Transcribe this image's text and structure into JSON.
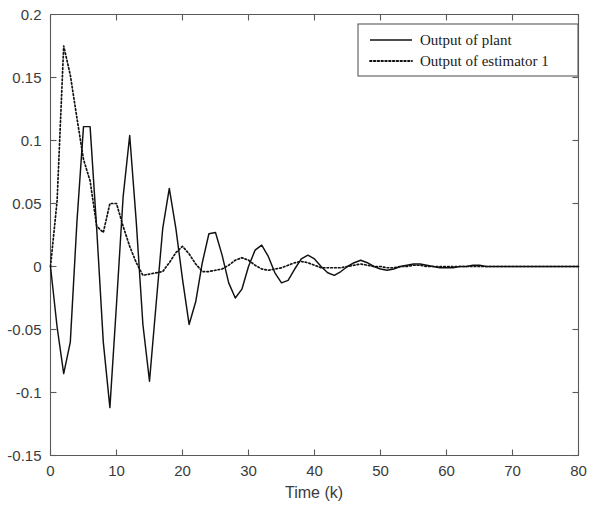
{
  "chart_data": {
    "type": "line",
    "title": "",
    "xlabel": "Time (k)",
    "ylabel": "",
    "xlim": [
      0,
      80
    ],
    "ylim": [
      -0.15,
      0.2
    ],
    "xticks": [
      0,
      10,
      20,
      30,
      40,
      50,
      60,
      70,
      80
    ],
    "xtick_labels": [
      "0",
      "10",
      "20",
      "30",
      "40",
      "50",
      "60",
      "70",
      "80"
    ],
    "yticks": [
      -0.15,
      -0.1,
      -0.05,
      0,
      0.05,
      0.1,
      0.15,
      0.2
    ],
    "ytick_labels": [
      "-0.15",
      "-0.1",
      "-0.05",
      "0",
      "0.05",
      "0.1",
      "0.15",
      "0.2"
    ],
    "grid": false,
    "legend_position": "upper right",
    "legend_entries": [
      {
        "label": "Output of plant",
        "style": "solid"
      },
      {
        "label": "Output of estimator 1",
        "style": "dotted"
      }
    ],
    "x": [
      0,
      1,
      2,
      3,
      4,
      5,
      6,
      7,
      8,
      9,
      10,
      11,
      12,
      13,
      14,
      15,
      16,
      17,
      18,
      19,
      20,
      21,
      22,
      23,
      24,
      25,
      26,
      27,
      28,
      29,
      30,
      31,
      32,
      33,
      34,
      35,
      36,
      37,
      38,
      39,
      40,
      41,
      42,
      43,
      44,
      45,
      46,
      47,
      48,
      49,
      50,
      51,
      52,
      53,
      54,
      55,
      56,
      57,
      58,
      59,
      60,
      61,
      62,
      63,
      64,
      65,
      66,
      67,
      68,
      69,
      70,
      71,
      72,
      73,
      74,
      75,
      76,
      77,
      78,
      79,
      80
    ],
    "series": [
      {
        "name": "Output of plant",
        "style": "solid",
        "values": [
          0,
          -0.048,
          -0.085,
          -0.06,
          0.035,
          0.111,
          0.111,
          0.03,
          -0.06,
          -0.112,
          -0.03,
          0.055,
          0.104,
          0.035,
          -0.046,
          -0.091,
          -0.03,
          0.03,
          0.062,
          0.03,
          -0.01,
          -0.046,
          -0.028,
          0.003,
          0.026,
          0.027,
          0.009,
          -0.013,
          -0.025,
          -0.018,
          0.0,
          0.013,
          0.017,
          0.008,
          -0.005,
          -0.013,
          -0.011,
          -0.002,
          0.006,
          0.009,
          0.006,
          0.0,
          -0.005,
          -0.007,
          -0.004,
          0.0,
          0.003,
          0.005,
          0.003,
          0.0,
          -0.002,
          -0.003,
          -0.002,
          0.0,
          0.001,
          0.002,
          0.002,
          0.001,
          0.0,
          -0.001,
          -0.001,
          -0.001,
          0.0,
          0.0,
          0.001,
          0.001,
          0.0,
          0.0,
          0.0,
          0.0,
          0.0,
          0.0,
          0.0,
          0.0,
          0.0,
          0.0,
          0.0,
          0.0,
          0.0,
          0.0,
          0.0
        ]
      },
      {
        "name": "Output of estimator 1",
        "style": "dotted",
        "values": [
          0,
          0.052,
          0.175,
          0.152,
          0.118,
          0.085,
          0.068,
          0.032,
          0.027,
          0.05,
          0.05,
          0.032,
          0.016,
          0.003,
          -0.007,
          -0.006,
          -0.005,
          -0.004,
          0.003,
          0.011,
          0.016,
          0.01,
          0.002,
          -0.004,
          -0.004,
          -0.003,
          -0.002,
          0.001,
          0.005,
          0.007,
          0.005,
          0.001,
          -0.002,
          -0.003,
          -0.002,
          -0.001,
          0.001,
          0.003,
          0.004,
          0.003,
          0.001,
          -0.001,
          -0.001,
          -0.001,
          -0.001,
          0.0,
          0.001,
          0.002,
          0.001,
          0.0,
          0.0,
          -0.001,
          -0.001,
          0.0,
          0.0,
          0.001,
          0.001,
          0.0,
          0.0,
          0.0,
          0.0,
          0.0,
          0.0,
          0.0,
          0.0,
          0.0,
          0.0,
          0.0,
          0.0,
          0.0,
          0.0,
          0.0,
          0.0,
          0.0,
          0.0,
          0.0,
          0.0,
          0.0,
          0.0,
          0.0,
          0.0
        ]
      }
    ]
  }
}
